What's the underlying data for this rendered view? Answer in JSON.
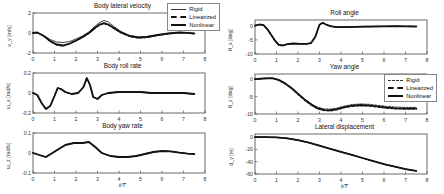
{
  "colors": {
    "line": "#141414",
    "axis": "#444444",
    "background": "#ffffff"
  },
  "legends": {
    "plot0": {
      "rigid": "Rigid",
      "linearized": "Linearized",
      "nonlinear": "Nonlinear"
    },
    "plot4": {
      "rigid": "Rigid",
      "linearized": "Linearized",
      "nonlinear": "Nonlinear"
    }
  },
  "chart_data": [
    {
      "type": "line",
      "title": "Body lateral velocity",
      "ylabel": "v_y [m/s]",
      "xlabel": "",
      "xlim": [
        0,
        8
      ],
      "ylim": [
        -2,
        2
      ],
      "xticks": [
        0,
        1,
        2,
        3,
        4,
        5,
        6,
        7,
        8
      ],
      "yticks": [
        -2,
        0,
        2
      ],
      "legend": {
        "position": "top-right",
        "entries": [
          "Rigid",
          "Linearized",
          "Nonlinear"
        ]
      },
      "x": [
        0,
        0.2,
        0.5,
        0.8,
        1.1,
        1.4,
        1.7,
        2.0,
        2.3,
        2.6,
        2.9,
        3.1,
        3.3,
        3.5,
        3.8,
        4.1,
        4.5,
        4.9,
        5.3,
        5.8,
        6.3,
        6.8,
        7.2,
        7.5
      ],
      "series": [
        {
          "name": "Rigid",
          "width": 0.8,
          "dash": "",
          "y": [
            0,
            0.05,
            -0.25,
            -0.65,
            -0.9,
            -0.95,
            -0.85,
            -0.6,
            -0.3,
            0.1,
            0.7,
            1.05,
            1.25,
            1.1,
            0.6,
            0.15,
            -0.25,
            -0.4,
            -0.35,
            -0.18,
            -0.03,
            0.06,
            0.03,
            -0.05
          ]
        },
        {
          "name": "Nonlinear",
          "width": 1.8,
          "dash": "",
          "y": [
            0,
            0.05,
            -0.3,
            -0.8,
            -1.15,
            -1.25,
            -1.05,
            -0.75,
            -0.4,
            0,
            0.55,
            0.85,
            1.0,
            0.85,
            0.45,
            0.05,
            -0.3,
            -0.45,
            -0.4,
            -0.2,
            -0.05,
            0.05,
            0.02,
            -0.05
          ]
        },
        {
          "name": "Linearized",
          "width": 1.2,
          "dash": "2.5,1.8",
          "y": [
            0,
            0.05,
            -0.3,
            -0.85,
            -1.2,
            -1.3,
            -1.1,
            -0.8,
            -0.45,
            -0.05,
            0.5,
            0.8,
            0.92,
            0.8,
            0.4,
            0,
            -0.35,
            -0.5,
            -0.45,
            -0.25,
            -0.08,
            0.02,
            0,
            -0.08
          ]
        }
      ]
    },
    {
      "type": "line",
      "title": "Body roll rate",
      "ylabel": "ω_x [rad/s]",
      "xlabel": "",
      "xlim": [
        0,
        8
      ],
      "ylim": [
        -0.2,
        0.2
      ],
      "xticks": [
        0,
        1,
        2,
        3,
        4,
        5,
        6,
        7,
        8
      ],
      "yticks": [
        -0.2,
        0,
        0.2
      ],
      "x": [
        0,
        0.2,
        0.4,
        0.6,
        0.8,
        1.0,
        1.15,
        1.3,
        1.5,
        1.8,
        2.1,
        2.35,
        2.5,
        2.65,
        2.8,
        3.0,
        3.2,
        3.5,
        4.0,
        4.5,
        5.0,
        5.5,
        6.0,
        6.5,
        7.0,
        7.5
      ],
      "series": [
        {
          "name": "Rigid",
          "width": 0.8,
          "dash": "",
          "y": [
            0,
            -0.02,
            -0.1,
            -0.16,
            -0.13,
            -0.03,
            0.05,
            0.04,
            0.01,
            -0.01,
            0,
            0.06,
            0.15,
            0.08,
            -0.04,
            -0.06,
            -0.02,
            0,
            0.01,
            0.01,
            0.01,
            0,
            0,
            0,
            0,
            -0.01
          ]
        },
        {
          "name": "Nonlinear",
          "width": 1.8,
          "dash": "",
          "y": [
            0,
            -0.02,
            -0.1,
            -0.16,
            -0.13,
            -0.03,
            0.05,
            0.04,
            0.01,
            -0.01,
            0,
            0.06,
            0.15,
            0.08,
            -0.04,
            -0.06,
            -0.02,
            0,
            0.01,
            0.01,
            0.01,
            0,
            0,
            0,
            0,
            -0.01
          ]
        },
        {
          "name": "Linearized",
          "width": 1.2,
          "dash": "2.5,1.8",
          "y": [
            0,
            -0.02,
            -0.1,
            -0.16,
            -0.13,
            -0.03,
            0.05,
            0.04,
            0.01,
            -0.01,
            0,
            0.06,
            0.15,
            0.08,
            -0.04,
            -0.06,
            -0.02,
            0,
            0.01,
            0.01,
            0.01,
            0,
            0,
            0,
            0,
            -0.01
          ]
        }
      ]
    },
    {
      "type": "line",
      "title": "Body yaw rate",
      "ylabel": "ω_z [rad/s]",
      "xlabel": "t/T",
      "xlim": [
        0,
        8
      ],
      "ylim": [
        -0.1,
        0.1
      ],
      "xticks": [
        0,
        1,
        2,
        3,
        4,
        5,
        6,
        7,
        8
      ],
      "yticks": [
        -0.1,
        0,
        0.1
      ],
      "x": [
        0,
        0.3,
        0.6,
        0.9,
        1.2,
        1.5,
        1.9,
        2.3,
        2.6,
        2.9,
        3.2,
        3.6,
        4.0,
        4.4,
        4.8,
        5.2,
        5.6,
        6.0,
        6.4,
        6.8,
        7.2,
        7.5
      ],
      "series": [
        {
          "name": "Rigid",
          "width": 0.8,
          "dash": "",
          "y": [
            0,
            -0.01,
            -0.02,
            0,
            0.02,
            0.04,
            0.05,
            0.05,
            0.055,
            0.03,
            0,
            -0.015,
            -0.02,
            -0.02,
            -0.015,
            -0.005,
            0.005,
            0.01,
            0.008,
            0.002,
            -0.003,
            -0.005
          ]
        },
        {
          "name": "Nonlinear",
          "width": 1.8,
          "dash": "",
          "y": [
            0,
            -0.01,
            -0.02,
            0,
            0.02,
            0.04,
            0.05,
            0.05,
            0.055,
            0.03,
            0,
            -0.015,
            -0.02,
            -0.02,
            -0.015,
            -0.005,
            0.005,
            0.01,
            0.008,
            0.002,
            -0.003,
            -0.005
          ]
        },
        {
          "name": "Linearized",
          "width": 1.2,
          "dash": "2.5,1.8",
          "y": [
            0,
            -0.01,
            -0.02,
            0,
            0.02,
            0.04,
            0.05,
            0.05,
            0.055,
            0.03,
            0,
            -0.015,
            -0.02,
            -0.02,
            -0.015,
            -0.005,
            0.005,
            0.01,
            0.008,
            0.002,
            -0.003,
            -0.005
          ]
        }
      ]
    },
    {
      "type": "line",
      "title": "Roll angle",
      "ylabel": "θ_x [deg]",
      "xlabel": "",
      "xlim": [
        0,
        8
      ],
      "ylim": [
        -10,
        2
      ],
      "xticks": [
        0,
        1,
        2,
        3,
        4,
        5,
        6,
        7,
        8
      ],
      "yticks": [
        -10,
        -5,
        0
      ],
      "x": [
        0,
        0.2,
        0.4,
        0.6,
        0.9,
        1.1,
        1.3,
        1.5,
        1.8,
        2.1,
        2.4,
        2.6,
        2.8,
        3.0,
        3.15,
        3.3,
        3.5,
        3.8,
        4.2,
        4.6,
        5.0,
        5.5,
        6.0,
        6.5,
        7.0,
        7.5
      ],
      "series": [
        {
          "name": "Rigid",
          "width": 0.8,
          "dash": "",
          "y": [
            0,
            0.4,
            0.2,
            -1.5,
            -5,
            -6.8,
            -7,
            -6.5,
            -6.3,
            -6.4,
            -6.4,
            -6.2,
            -4,
            0.3,
            1.0,
            0.4,
            -0.2,
            -0.5,
            -0.5,
            -0.45,
            -0.35,
            -0.3,
            -0.25,
            -0.2,
            -0.25,
            -0.3
          ]
        },
        {
          "name": "Nonlinear",
          "width": 1.8,
          "dash": "",
          "y": [
            0,
            0.4,
            0.2,
            -1.5,
            -5,
            -6.8,
            -7,
            -6.5,
            -6.3,
            -6.4,
            -6.4,
            -6.2,
            -4,
            0.3,
            1.0,
            0.4,
            -0.2,
            -0.5,
            -0.5,
            -0.45,
            -0.35,
            -0.3,
            -0.25,
            -0.2,
            -0.25,
            -0.3
          ]
        },
        {
          "name": "Linearized",
          "width": 1.2,
          "dash": "2.5,1.8",
          "y": [
            0,
            0.4,
            0.2,
            -1.5,
            -5,
            -6.8,
            -7,
            -6.5,
            -6.3,
            -6.4,
            -6.4,
            -6.2,
            -4,
            0.3,
            1.0,
            0.4,
            -0.2,
            -0.5,
            -0.5,
            -0.45,
            -0.35,
            -0.3,
            -0.25,
            -0.2,
            -0.25,
            -0.3
          ]
        }
      ]
    },
    {
      "type": "line",
      "title": "Yaw angle",
      "ylabel": "θ_z [deg]",
      "xlabel": "",
      "xlim": [
        0,
        8
      ],
      "ylim": [
        -10,
        1.5
      ],
      "xticks": [
        0,
        1,
        2,
        3,
        4,
        5,
        6,
        7,
        8
      ],
      "yticks": [
        -10,
        -5,
        0
      ],
      "legend": {
        "position": "inside-top-right",
        "entries": [
          "Rigid",
          "Linearized",
          "Nonlinear"
        ]
      },
      "x": [
        0,
        0.4,
        0.8,
        1.1,
        1.4,
        1.7,
        2.0,
        2.3,
        2.6,
        2.9,
        3.2,
        3.5,
        3.8,
        4.1,
        4.5,
        4.9,
        5.3,
        5.7,
        6.1,
        6.5,
        7.0,
        7.5
      ],
      "series": [
        {
          "name": "Rigid",
          "width": 0.8,
          "dash": "2,1.5",
          "y": [
            0,
            0.2,
            0.3,
            -0.2,
            -1.1,
            -2.4,
            -4.0,
            -5.6,
            -7.0,
            -8.0,
            -8.5,
            -8.6,
            -8.3,
            -7.8,
            -7.3,
            -7.1,
            -7.2,
            -7.5,
            -7.8,
            -8.0,
            -8.1,
            -8.1
          ]
        },
        {
          "name": "Nonlinear",
          "width": 1.8,
          "dash": "",
          "y": [
            0,
            0.2,
            0.3,
            -0.2,
            -1.2,
            -2.5,
            -4.2,
            -5.8,
            -7.2,
            -8.3,
            -8.8,
            -8.9,
            -8.6,
            -8.1,
            -7.6,
            -7.4,
            -7.5,
            -7.8,
            -8.1,
            -8.3,
            -8.4,
            -8.4
          ]
        },
        {
          "name": "Linearized",
          "width": 1.2,
          "dash": "2.5,1.8",
          "y": [
            0,
            0.2,
            0.3,
            -0.3,
            -1.3,
            -2.7,
            -4.4,
            -6.0,
            -7.4,
            -8.5,
            -9.0,
            -9.1,
            -8.8,
            -8.3,
            -7.8,
            -7.6,
            -7.7,
            -8.0,
            -8.3,
            -8.5,
            -8.6,
            -8.6
          ]
        }
      ]
    },
    {
      "type": "line",
      "title": "Lateral displacement",
      "ylabel": "d_y [m]",
      "xlabel": "t/T",
      "xlim": [
        0,
        8
      ],
      "ylim": [
        -60,
        5
      ],
      "xticks": [
        0,
        1,
        2,
        3,
        4,
        5,
        6,
        7,
        8
      ],
      "yticks": [
        -60,
        -40,
        -20,
        0
      ],
      "x": [
        0,
        0.5,
        1.0,
        1.5,
        2.0,
        2.5,
        3.0,
        3.5,
        4.0,
        4.5,
        5.0,
        5.5,
        6.0,
        6.5,
        7.0,
        7.5
      ],
      "series": [
        {
          "name": "Rigid",
          "width": 0.8,
          "dash": "",
          "y": [
            0,
            0,
            -0.5,
            -2,
            -5,
            -9,
            -14,
            -19,
            -24,
            -29,
            -34,
            -39,
            -44,
            -48,
            -52,
            -55
          ]
        },
        {
          "name": "Nonlinear",
          "width": 1.8,
          "dash": "",
          "y": [
            0,
            0,
            -0.5,
            -2,
            -5,
            -9,
            -14,
            -19,
            -24,
            -29,
            -34,
            -39,
            -44,
            -48,
            -52,
            -55
          ]
        },
        {
          "name": "Linearized",
          "width": 1.2,
          "dash": "2.5,1.8",
          "y": [
            0,
            0,
            -0.5,
            -2,
            -5,
            -9,
            -14,
            -19,
            -24,
            -29,
            -34,
            -39,
            -44,
            -48,
            -52,
            -55
          ]
        }
      ]
    }
  ]
}
